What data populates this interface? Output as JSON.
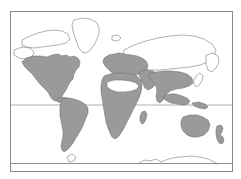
{
  "figure": {
    "kind": "world-distribution-map",
    "projection": "equirectangular",
    "title": "",
    "caption": "",
    "canvas": {
      "width": 241,
      "height": 179
    },
    "background_color": "#ffffff"
  },
  "frame": {
    "name": "map-border",
    "x": 10.5,
    "y": 11.5,
    "width": 222,
    "height": 160,
    "stroke": "#8a8a8a",
    "stroke_width": 1,
    "fill": "#ffffff"
  },
  "graticule": {
    "lines": [
      {
        "label": "equator",
        "orientation": "horizontal",
        "y": 105,
        "stroke": "#b0b0b0",
        "stroke_width": 1
      },
      {
        "label": "southern-reference-line",
        "orientation": "horizontal",
        "y": 163.5,
        "stroke": "#8f8f8f",
        "stroke_width": 1
      }
    ],
    "grid": "minimal"
  },
  "legend": {
    "shaded_meaning": "distribution range",
    "unshaded_meaning": "outside range",
    "visible": false
  },
  "style": {
    "coastline_stroke": "#6e6e6e",
    "coastline_stroke_width": 0.55,
    "shaded_fill": "#9a9a9a",
    "unshaded_fill": "#ffffff",
    "hole_fill": "#ffffff"
  },
  "regions": [
    {
      "name": "north-america",
      "shaded": true,
      "label": "North America",
      "path": "M 22 62 L 26 58 L 33 56 L 40 56 L 47 57 L 52 55 L 58 54 L 62 56 L 66 55 L 70 57 L 74 56 L 78 58 L 80 62 L 79 67 L 76 70 L 74 74 L 73 79 L 70 82 L 68 86 L 66 90 L 64 93 L 62 96 L 60 99 L 58 101 L 55 101 L 52 99 L 50 96 L 48 92 L 45 89 L 42 86 L 39 83 L 36 79 L 33 75 L 30 72 L 27 69 L 24 66 Z"
    },
    {
      "name": "central-america-caribbean",
      "shaded": true,
      "label": "Central America and Caribbean",
      "path": "M 57 98 L 62 97 L 67 98 L 71 99 L 74 101 L 76 103 L 74 105 L 70 105 L 66 104 L 62 103 L 58 102 Z"
    },
    {
      "name": "south-america",
      "shaded": true,
      "label": "South America",
      "path": "M 62 99 L 68 98 L 74 99 L 80 101 L 85 104 L 88 108 L 88 113 L 86 118 L 84 123 L 82 128 L 79 133 L 76 138 L 73 143 L 70 147 L 67 150 L 64 152 L 62 150 L 61 146 L 62 141 L 63 136 L 63 131 L 62 126 L 61 121 L 60 116 L 60 111 L 60 106 L 61 102 Z"
    },
    {
      "name": "europe",
      "shaded": true,
      "label": "Europe",
      "path": "M 104 58 L 109 55 L 114 54 L 119 53 L 125 54 L 131 55 L 137 56 L 142 58 L 146 61 L 148 65 L 147 69 L 144 72 L 140 74 L 135 75 L 130 76 L 125 76 L 120 75 L 115 74 L 111 72 L 108 69 L 105 66 L 103 62 Z"
    },
    {
      "name": "sub-saharan-africa",
      "shaded": true,
      "label": "Sub-Saharan Africa",
      "path": "M 104 76 L 110 74 L 117 73 L 124 73 L 131 74 L 137 76 L 141 80 L 142 86 L 141 92 L 139 98 L 136 104 L 133 110 L 130 116 L 127 122 L 124 128 L 121 133 L 118 137 L 115 139 L 112 137 L 110 133 L 108 128 L 106 122 L 105 116 L 104 110 L 103 104 L 102 98 L 101 92 L 101 86 L 102 80 Z"
    },
    {
      "name": "sahara-desert-hole",
      "shaded": false,
      "is_hole": true,
      "label": "Sahara (unoccupied)",
      "path": "M 107 82 L 114 80 L 122 80 L 130 81 L 136 83 L 139 86 L 137 89 L 132 91 L 125 92 L 117 92 L 111 90 L 107 87 Z"
    },
    {
      "name": "madagascar",
      "shaded": true,
      "label": "Madagascar",
      "path": "M 142 112 L 145 111 L 147 114 L 146 119 L 144 123 L 142 124 L 140 121 L 140 116 Z"
    },
    {
      "name": "arabian-west-asia",
      "shaded": true,
      "label": "West Asia",
      "path": "M 140 71 L 147 70 L 153 71 L 157 74 L 158 79 L 156 84 L 152 88 L 148 90 L 145 88 L 143 84 L 141 79 L 139 75 Z"
    },
    {
      "name": "south-asia",
      "shaded": true,
      "label": "South Asia",
      "path": "M 148 74 L 156 72 L 164 71 L 172 71 L 180 72 L 187 74 L 192 78 L 193 83 L 189 86 L 183 88 L 176 89 L 170 91 L 166 95 L 163 100 L 160 103 L 157 101 L 156 96 L 157 91 L 156 86 L 153 82 L 150 78 Z"
    },
    {
      "name": "southeast-asia-indonesia",
      "shaded": true,
      "label": "Southeast Asia and Indonesia",
      "path": "M 164 96 L 170 94 L 176 94 L 182 96 L 187 98 L 190 101 L 188 104 L 183 105 L 177 104 L 171 103 L 167 101 L 164 99 Z"
    },
    {
      "name": "new-guinea",
      "shaded": true,
      "label": "New Guinea",
      "path": "M 192 103 L 199 102 L 205 104 L 208 107 L 205 109 L 199 108 L 194 106 Z"
    },
    {
      "name": "australia",
      "shaded": true,
      "label": "Australia",
      "path": "M 183 117 L 190 115 L 197 115 L 203 117 L 208 120 L 210 125 L 208 131 L 204 135 L 198 137 L 192 137 L 187 135 L 183 131 L 181 126 L 181 121 Z"
    },
    {
      "name": "new-zealand",
      "shaded": true,
      "label": "New Zealand",
      "path": "M 217 126 L 221 125 L 223 128 L 222 132 L 220 135 L 223 137 L 224 141 L 222 144 L 219 143 L 217 139 L 216 134 L 216 130 Z"
    }
  ],
  "outlines": [
    {
      "name": "greenland",
      "label": "Greenland",
      "shaded": false,
      "path": "M 74 20 L 82 18 L 90 19 L 96 22 L 99 27 L 99 33 L 97 39 L 94 45 L 90 50 L 86 53 L 82 52 L 79 48 L 77 43 L 75 37 L 73 31 L 72 25 Z"
    },
    {
      "name": "arctic-canada",
      "label": "Canadian Arctic Archipelago",
      "shaded": false,
      "path": "M 22 40 L 30 36 L 38 33 L 46 31 L 54 30 L 62 31 L 68 34 L 70 39 L 66 43 L 58 45 L 50 46 L 42 47 L 34 48 L 27 47 L 22 45 Z"
    },
    {
      "name": "alaska",
      "label": "Alaska",
      "shaded": false,
      "path": "M 14 50 L 22 47 L 30 48 L 34 52 L 32 57 L 26 59 L 19 58 L 14 55 Z"
    },
    {
      "name": "northern-eurasia-siberia",
      "label": "Northern Eurasia and Siberia",
      "shaded": false,
      "path": "M 124 50 L 134 45 L 146 41 L 158 38 L 170 36 L 182 35 L 194 36 L 204 39 L 212 44 L 216 50 L 214 57 L 208 62 L 200 65 L 190 67 L 180 68 L 170 69 L 160 70 L 150 70 L 140 69 L 132 66 L 126 61 L 123 55 Z"
    },
    {
      "name": "kamchatka-far-east",
      "label": "Russian Far East",
      "shaded": false,
      "path": "M 206 55 L 213 53 L 218 56 L 219 62 L 216 68 L 212 72 L 208 70 L 206 64 Z"
    },
    {
      "name": "japan",
      "label": "Japan",
      "shaded": false,
      "path": "M 196 76 L 200 73 L 203 76 L 202 81 L 199 85 L 196 87 L 194 84 L 194 80 Z"
    },
    {
      "name": "iceland",
      "label": "Iceland",
      "shaded": false,
      "path": "M 112 36 L 118 35 L 121 38 L 118 41 L 112 40 Z"
    },
    {
      "name": "antarctic-coast",
      "label": "Antarctic coastline",
      "shaded": false,
      "path": "M 138 164 L 144 160 L 150 161 L 156 159 L 161 162 L 166 160 L 172 158 L 180 157 L 190 156 L 200 157 L 208 159 L 214 162 L 218 164"
    },
    {
      "name": "southern-island",
      "label": "Southern island",
      "shaded": false,
      "path": "M 67 157 L 72 154 L 76 157 L 74 161 L 69 162 Z"
    }
  ]
}
